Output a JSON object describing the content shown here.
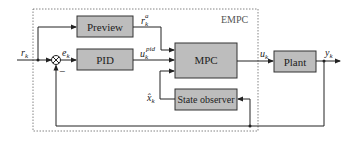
{
  "diagram": {
    "container": {
      "label": "EMPC"
    },
    "blocks": {
      "preview": "Preview",
      "pid": "PID",
      "mpc": "MPC",
      "observer": "State observer",
      "plant": "Plant"
    },
    "signals": {
      "reference": {
        "base": "r",
        "sub": "k",
        "sup": ""
      },
      "error": {
        "base": "e",
        "sub": "k",
        "sup": ""
      },
      "preview_out": {
        "base": "r",
        "sub": "k",
        "sup": "a"
      },
      "pid_out": {
        "base": "u",
        "sub": "k",
        "sup": "pid"
      },
      "state_est": {
        "base": "x̂",
        "sub": "k",
        "sup": ""
      },
      "control": {
        "base": "u",
        "sub": "k",
        "sup": ""
      },
      "output": {
        "base": "y",
        "sub": "k",
        "sup": ""
      }
    },
    "junction_sign": "−"
  }
}
